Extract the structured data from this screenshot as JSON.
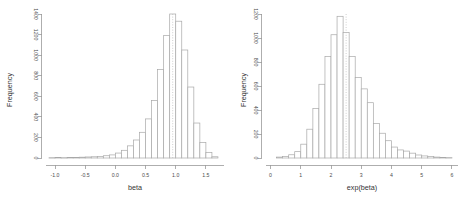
{
  "figure": {
    "panel_count": 2,
    "background": "#ffffff",
    "stroke_color": "#a8a8a8",
    "axis_color": "#9a9a9a",
    "text_color": "#4d4d4d"
  },
  "chart_data": [
    {
      "type": "bar",
      "id": "histogram-beta",
      "title": "",
      "xlabel": "beta",
      "ylabel": "Frequency",
      "xlim": [
        -1.15,
        1.8
      ],
      "ylim": [
        0,
        1400
      ],
      "grid": false,
      "legend": null,
      "xticks": [
        "-1.0",
        "-0.5",
        "0.0",
        "0.5",
        "1.0",
        "1.5"
      ],
      "xtick_values": [
        -1.0,
        -0.5,
        0.0,
        0.5,
        1.0,
        1.5
      ],
      "yticks": [
        "0",
        "200",
        "400",
        "600",
        "800",
        "1000",
        "1200",
        "1400"
      ],
      "ytick_values": [
        0,
        200,
        400,
        600,
        800,
        1000,
        1200,
        1400
      ],
      "bin_width": 0.1,
      "bin_starts": [
        -1.1,
        -1.0,
        -0.9,
        -0.8,
        -0.7,
        -0.6,
        -0.5,
        -0.4,
        -0.3,
        -0.2,
        -0.1,
        0.0,
        0.1,
        0.2,
        0.3,
        0.4,
        0.5,
        0.6,
        0.7,
        0.8,
        0.9,
        1.0,
        1.1,
        1.2,
        1.3,
        1.4,
        1.5,
        1.6
      ],
      "values": [
        3,
        4,
        3,
        5,
        6,
        8,
        10,
        12,
        16,
        22,
        30,
        48,
        75,
        118,
        175,
        250,
        380,
        560,
        860,
        1190,
        1400,
        1330,
        1050,
        690,
        340,
        150,
        55,
        12
      ],
      "annotations": [
        {
          "type": "vline",
          "x": 0.95,
          "style": "dotted",
          "label": ""
        }
      ]
    },
    {
      "type": "bar",
      "id": "histogram-exp-beta",
      "title": "",
      "xlabel": "exp(beta)",
      "ylabel": "Frequency",
      "xlim": [
        -0.15,
        6.2
      ],
      "ylim": [
        0,
        1250
      ],
      "grid": false,
      "legend": null,
      "xticks": [
        "0",
        "1",
        "2",
        "3",
        "4",
        "5",
        "6"
      ],
      "xtick_values": [
        0,
        1,
        2,
        3,
        4,
        5,
        6
      ],
      "yticks": [
        "0",
        "200",
        "400",
        "600",
        "800",
        "1000",
        "1200"
      ],
      "ytick_values": [
        0,
        200,
        400,
        600,
        800,
        1000,
        1200
      ],
      "bin_width": 0.2,
      "bin_starts": [
        0.2,
        0.4,
        0.6,
        0.8,
        1.0,
        1.2,
        1.4,
        1.6,
        1.8,
        2.0,
        2.2,
        2.4,
        2.6,
        2.8,
        3.0,
        3.2,
        3.4,
        3.6,
        3.8,
        4.0,
        4.2,
        4.4,
        4.6,
        4.8,
        5.0,
        5.2,
        5.4,
        5.6,
        5.8
      ],
      "values": [
        8,
        14,
        28,
        55,
        120,
        250,
        430,
        640,
        880,
        1070,
        1230,
        1090,
        880,
        700,
        600,
        480,
        300,
        215,
        150,
        95,
        70,
        60,
        42,
        26,
        18,
        12,
        8,
        5,
        3
      ],
      "annotations": [
        {
          "type": "vline",
          "x": 2.5,
          "style": "dotted",
          "label": ""
        }
      ]
    }
  ]
}
